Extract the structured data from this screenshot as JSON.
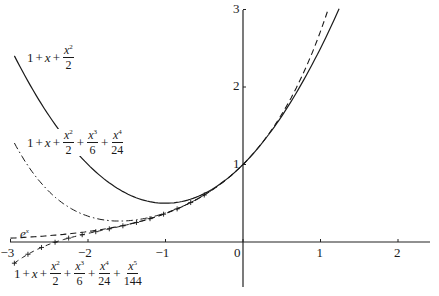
{
  "chart_data": {
    "type": "line",
    "title": "",
    "xlabel": "",
    "ylabel": "",
    "xlim": [
      -3,
      2.4
    ],
    "ylim": [
      -0.55,
      3
    ],
    "grid": false,
    "legend": "inline labels",
    "x_ticks": [
      "-3",
      "-2",
      "-1",
      "0",
      "1",
      "2"
    ],
    "y_ticks": [
      "1",
      "2",
      "3"
    ],
    "series": [
      {
        "name": "1 + x + x^2/2",
        "style": "solid",
        "coeffs": [
          1,
          1,
          0.5
        ],
        "x_range": [
          -2.95,
          1.24
        ]
      },
      {
        "name": "1 + x + x^2/2 + x^3/6 + x^4/24",
        "style": "dash-dot",
        "coeffs": [
          1,
          1,
          0.5,
          0.16667,
          0.041667
        ],
        "x_range": [
          -2.95,
          0.1
        ]
      },
      {
        "name": "e^x",
        "style": "dashed",
        "func": "exp",
        "x_range": [
          -3,
          1.0986
        ]
      },
      {
        "name": "1 + x + x^2/2 + x^3/6 + x^4/24 + x^5/144",
        "style": "dash-plus",
        "coeffs": [
          1,
          1,
          0.5,
          0.16667,
          0.041667,
          0.0069444
        ],
        "x_range": [
          -2.95,
          -0.5
        ]
      }
    ]
  },
  "labels": {
    "quad": {
      "lead": "1",
      "x": "x",
      "n2": "x",
      "e2": "2",
      "d2": "2"
    },
    "quartic": {
      "lead": "1",
      "x": "x",
      "n2": "x",
      "e2": "2",
      "d2": "2",
      "n3": "x",
      "e3": "3",
      "d3": "6",
      "n4": "x",
      "e4": "4",
      "d4": "24"
    },
    "exp": {
      "base": "e",
      "exp": "x"
    },
    "quintic": {
      "lead": "1",
      "x": "x",
      "n2": "x",
      "e2": "2",
      "d2": "2",
      "n3": "x",
      "e3": "3",
      "d3": "6",
      "n4": "x",
      "e4": "4",
      "d4": "24",
      "n5": "x",
      "e5": "5",
      "d5": "144"
    },
    "plus": "+"
  },
  "axes": {
    "x_ticks": [
      {
        "value": -3,
        "label": "−3"
      },
      {
        "value": -2,
        "label": "−2"
      },
      {
        "value": -1,
        "label": "−1"
      },
      {
        "value": 0,
        "label": "0"
      },
      {
        "value": 1,
        "label": "1"
      },
      {
        "value": 2,
        "label": "2"
      }
    ],
    "y_ticks": [
      {
        "value": 1,
        "label": "1"
      },
      {
        "value": 2,
        "label": "2"
      },
      {
        "value": 3,
        "label": "3"
      }
    ]
  }
}
